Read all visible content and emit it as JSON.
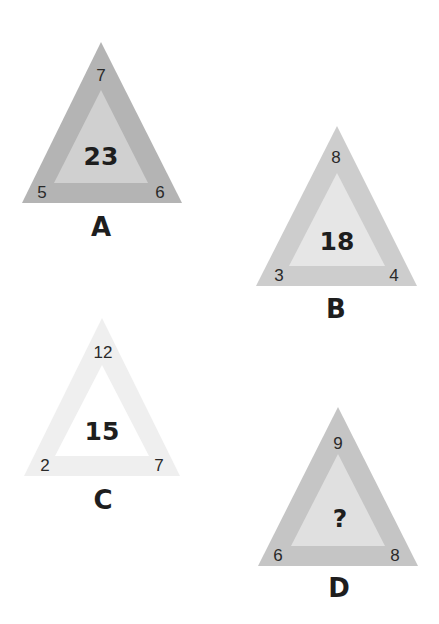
{
  "puzzle": {
    "triangles": [
      {
        "label": "A",
        "top": "7",
        "left": "5",
        "right": "6",
        "center": "23",
        "outer_color": "#b4b4b4",
        "inner_color": "#d0d0d0",
        "apex": [
          101,
          42
        ],
        "base_left": [
          22,
          203
        ],
        "base_right": [
          182,
          203
        ],
        "inner_apex": [
          101,
          90
        ],
        "inner_base_left": [
          54,
          183
        ],
        "inner_base_right": [
          148,
          183
        ],
        "top_pos": [
          101,
          75
        ],
        "left_pos": [
          42,
          192
        ],
        "right_pos": [
          160,
          192
        ],
        "center_pos": [
          101,
          156
        ],
        "label_pos": [
          101,
          227
        ]
      },
      {
        "label": "B",
        "top": "8",
        "left": "3",
        "right": "4",
        "center": "18",
        "outer_color": "#cdcdcd",
        "inner_color": "#e6e6e6",
        "apex": [
          337,
          126
        ],
        "base_left": [
          256,
          286
        ],
        "base_right": [
          417,
          286
        ],
        "inner_apex": [
          337,
          173
        ],
        "inner_base_left": [
          289,
          266
        ],
        "inner_base_right": [
          385,
          266
        ],
        "top_pos": [
          336,
          157
        ],
        "left_pos": [
          279,
          275
        ],
        "right_pos": [
          394,
          275
        ],
        "center_pos": [
          337,
          241
        ],
        "label_pos": [
          336,
          309
        ]
      },
      {
        "label": "C",
        "top": "12",
        "left": "2",
        "right": "7",
        "center": "15",
        "outer_color": "#efefef",
        "inner_color": "#ffffff",
        "apex": [
          102,
          318
        ],
        "base_left": [
          24,
          476
        ],
        "base_right": [
          180,
          476
        ],
        "inner_apex": [
          102,
          365
        ],
        "inner_base_left": [
          55,
          456
        ],
        "inner_base_right": [
          149,
          456
        ],
        "top_pos": [
          103,
          352
        ],
        "left_pos": [
          45,
          465
        ],
        "right_pos": [
          159,
          465
        ],
        "center_pos": [
          102,
          431
        ],
        "label_pos": [
          103,
          500
        ]
      },
      {
        "label": "D",
        "top": "9",
        "left": "6",
        "right": "8",
        "center": "?",
        "outer_color": "#c5c5c5",
        "inner_color": "#e0e0e0",
        "apex": [
          338,
          407
        ],
        "base_left": [
          258,
          566
        ],
        "base_right": [
          418,
          566
        ],
        "inner_apex": [
          338,
          454
        ],
        "inner_base_left": [
          291,
          546
        ],
        "inner_base_right": [
          385,
          546
        ],
        "top_pos": [
          338,
          443
        ],
        "left_pos": [
          278,
          555
        ],
        "right_pos": [
          395,
          555
        ],
        "center_pos": [
          340,
          518
        ],
        "label_pos": [
          339,
          588
        ]
      }
    ]
  }
}
